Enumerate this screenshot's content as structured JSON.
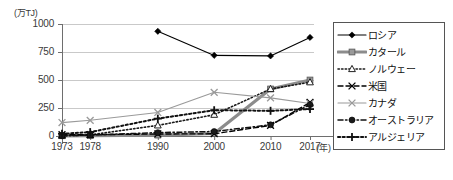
{
  "chart_data": {
    "type": "line",
    "title": "",
    "xlabel": "(年)",
    "ylabel": "(万TJ)",
    "unit_label": "(万TJ)",
    "x_unit_label": "(年)",
    "categories": [
      "1973",
      "1978",
      "1990",
      "2000",
      "2010",
      "2017"
    ],
    "x_positions": [
      1973,
      1978,
      1990,
      2000,
      2010,
      2017
    ],
    "ylim": [
      0,
      1000
    ],
    "yticks": [
      "0",
      "250",
      "500",
      "750",
      "1000"
    ],
    "ytick_values": [
      0,
      250,
      500,
      750,
      1000
    ],
    "grid": true,
    "legend_position": "right",
    "series": [
      {
        "name": "ロシア",
        "color": "#000000",
        "line_style": "solid",
        "line_width": 1.1,
        "marker": "diamond",
        "values": [
          null,
          null,
          935,
          720,
          715,
          880
        ]
      },
      {
        "name": "カタール",
        "color": "#8c8c8c",
        "line_style": "solid",
        "line_width": 3.2,
        "marker": "square",
        "values": [
          2,
          4,
          8,
          22,
          420,
          500
        ]
      },
      {
        "name": "ノルウェー",
        "color": "#1a1a1a",
        "line_style": "dotted",
        "line_width": 1.6,
        "marker": "triangle-open",
        "values": [
          2,
          10,
          95,
          190,
          420,
          480
        ]
      },
      {
        "name": "米国",
        "color": "#000000",
        "line_style": "dashed",
        "line_width": 1.4,
        "marker": "x",
        "values": [
          12,
          12,
          18,
          20,
          95,
          300
        ]
      },
      {
        "name": "カナダ",
        "color": "#9a9a9a",
        "line_style": "solid",
        "line_width": 1.1,
        "marker": "x",
        "values": [
          120,
          140,
          210,
          390,
          340,
          290
        ]
      },
      {
        "name": "オーストラリア",
        "color": "#111111",
        "line_style": "dashdot",
        "line_width": 1.5,
        "marker": "circle",
        "values": [
          2,
          8,
          30,
          40,
          100,
          280
        ]
      },
      {
        "name": "アルジェリア",
        "color": "#111111",
        "line_style": "dotted-thick",
        "line_width": 2.0,
        "marker": "plus",
        "values": [
          20,
          35,
          155,
          230,
          225,
          240
        ]
      }
    ]
  },
  "legend": {
    "items": [
      {
        "label": "ロシア"
      },
      {
        "label": "カタール"
      },
      {
        "label": "ノルウェー"
      },
      {
        "label": "米国"
      },
      {
        "label": "カナダ"
      },
      {
        "label": "オーストラリア"
      },
      {
        "label": "アルジェリア"
      }
    ]
  }
}
